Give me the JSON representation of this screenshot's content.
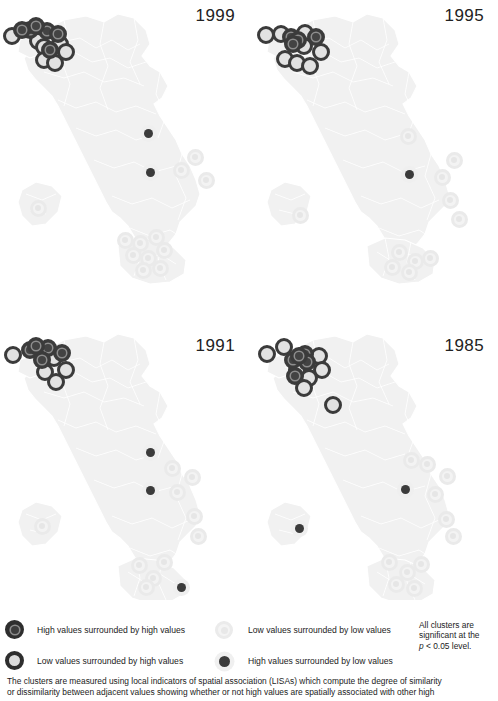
{
  "figure": {
    "caption_line1": "The clusters are measured using local indicators of spatial association (LISAs) which compute the degree of similarity",
    "caption_line2": "or dissimilarity between adjacent values showing whether or not high values are spatially associated with other high"
  },
  "legend": {
    "items": [
      {
        "key": "high-high",
        "icon": "ring-dark-core-dark-icon",
        "label": "High values surrounded by high values"
      },
      {
        "key": "low-high",
        "icon": "ring-dark-core-light-icon",
        "label": "Low values surrounded by high values"
      },
      {
        "key": "low-low",
        "icon": "ring-light-core-light-icon",
        "label": "Low values surrounded by low values"
      },
      {
        "key": "high-low",
        "icon": "dot-dark-solid-icon",
        "label": "High values surrounded by low values"
      }
    ],
    "significance_note": "All clusters are significant at the p < 0.05 level.",
    "significance_line1": "All clusters are",
    "significance_line2": "significant at the",
    "significance_line3_pre": "p",
    "significance_line3_post": " < 0.05 level."
  },
  "colors": {
    "high_high": "#3b3b3b",
    "low_high_ring": "#3b3b3b",
    "low_high_core": "#e2e2e2",
    "low_low": "#eaeaea",
    "high_low": "#3b3b3b",
    "map_fill": "#f1f1f1",
    "map_border": "#ffffff",
    "background": "#ffffff",
    "text": "#1b1b1b"
  },
  "chart_data": {
    "type": "map",
    "panel_layout": "2x2",
    "marker_categories": [
      "high-high",
      "low-high",
      "low-low",
      "high-low"
    ],
    "panels": [
      {
        "year": "1999",
        "counts": {
          "high-high": 7,
          "low-high": 7,
          "low-low": 12,
          "high-low": 2
        },
        "markers": [
          {
            "t": "lh",
            "x": 12,
            "y": 36
          },
          {
            "t": "hh",
            "x": 30,
            "y": 30
          },
          {
            "t": "lh",
            "x": 38,
            "y": 41
          },
          {
            "t": "hh",
            "x": 47,
            "y": 31
          },
          {
            "t": "hh",
            "x": 58,
            "y": 34
          },
          {
            "t": "lh",
            "x": 44,
            "y": 47
          },
          {
            "t": "hh",
            "x": 50,
            "y": 50
          },
          {
            "t": "lh",
            "x": 60,
            "y": 44
          },
          {
            "t": "lh",
            "x": 44,
            "y": 60
          },
          {
            "t": "lh",
            "x": 55,
            "y": 63
          },
          {
            "t": "lh",
            "x": 66,
            "y": 52
          },
          {
            "t": "hh",
            "x": 36,
            "y": 26
          },
          {
            "t": "hh",
            "x": 22,
            "y": 30
          },
          {
            "t": "hl",
            "x": 148,
            "y": 133
          },
          {
            "t": "hl",
            "x": 150,
            "y": 172
          },
          {
            "t": "ll",
            "x": 195,
            "y": 157
          },
          {
            "t": "ll",
            "x": 181,
            "y": 170
          },
          {
            "t": "ll",
            "x": 206,
            "y": 180
          },
          {
            "t": "ll",
            "x": 38,
            "y": 208
          },
          {
            "t": "ll",
            "x": 125,
            "y": 240
          },
          {
            "t": "ll",
            "x": 140,
            "y": 243
          },
          {
            "t": "ll",
            "x": 156,
            "y": 237
          },
          {
            "t": "ll",
            "x": 133,
            "y": 255
          },
          {
            "t": "ll",
            "x": 148,
            "y": 258
          },
          {
            "t": "ll",
            "x": 164,
            "y": 250
          },
          {
            "t": "ll",
            "x": 160,
            "y": 268
          },
          {
            "t": "ll",
            "x": 143,
            "y": 270
          }
        ]
      },
      {
        "year": "1995",
        "counts": {
          "high-high": 6,
          "low-high": 8,
          "low-low": 12,
          "high-low": 1
        },
        "markers": [
          {
            "t": "lh",
            "x": 17,
            "y": 35
          },
          {
            "t": "lh",
            "x": 32,
            "y": 34
          },
          {
            "t": "hh",
            "x": 42,
            "y": 37
          },
          {
            "t": "hh",
            "x": 49,
            "y": 40
          },
          {
            "t": "lh",
            "x": 56,
            "y": 33
          },
          {
            "t": "hh",
            "x": 67,
            "y": 37
          },
          {
            "t": "lh",
            "x": 55,
            "y": 46
          },
          {
            "t": "lh",
            "x": 72,
            "y": 52
          },
          {
            "t": "lh",
            "x": 36,
            "y": 59
          },
          {
            "t": "lh",
            "x": 48,
            "y": 63
          },
          {
            "t": "lh",
            "x": 61,
            "y": 66
          },
          {
            "t": "hh",
            "x": 44,
            "y": 44
          },
          {
            "t": "hl",
            "x": 160,
            "y": 174
          },
          {
            "t": "ll",
            "x": 159,
            "y": 136
          },
          {
            "t": "ll",
            "x": 205,
            "y": 160
          },
          {
            "t": "ll",
            "x": 193,
            "y": 177
          },
          {
            "t": "ll",
            "x": 201,
            "y": 200
          },
          {
            "t": "ll",
            "x": 210,
            "y": 219
          },
          {
            "t": "ll",
            "x": 51,
            "y": 215
          },
          {
            "t": "ll",
            "x": 150,
            "y": 252
          },
          {
            "t": "ll",
            "x": 166,
            "y": 261
          },
          {
            "t": "ll",
            "x": 181,
            "y": 258
          },
          {
            "t": "ll",
            "x": 143,
            "y": 267
          },
          {
            "t": "ll",
            "x": 160,
            "y": 272
          }
        ]
      },
      {
        "year": "1991",
        "counts": {
          "high-high": 6,
          "low-high": 6,
          "low-low": 14,
          "high-low": 3
        },
        "markers": [
          {
            "t": "lh",
            "x": 13,
            "y": 55
          },
          {
            "t": "hh",
            "x": 30,
            "y": 50
          },
          {
            "t": "hh",
            "x": 48,
            "y": 48
          },
          {
            "t": "hh",
            "x": 62,
            "y": 53
          },
          {
            "t": "hh",
            "x": 42,
            "y": 60
          },
          {
            "t": "lh",
            "x": 54,
            "y": 58
          },
          {
            "t": "lh",
            "x": 45,
            "y": 72
          },
          {
            "t": "lh",
            "x": 66,
            "y": 70
          },
          {
            "t": "lh",
            "x": 56,
            "y": 82
          },
          {
            "t": "hh",
            "x": 36,
            "y": 46
          },
          {
            "t": "hl",
            "x": 150,
            "y": 152
          },
          {
            "t": "hl",
            "x": 150,
            "y": 190
          },
          {
            "t": "hl",
            "x": 181,
            "y": 287
          },
          {
            "t": "ll",
            "x": 172,
            "y": 168
          },
          {
            "t": "ll",
            "x": 192,
            "y": 177
          },
          {
            "t": "ll",
            "x": 177,
            "y": 192
          },
          {
            "t": "ll",
            "x": 194,
            "y": 216
          },
          {
            "t": "ll",
            "x": 198,
            "y": 236
          },
          {
            "t": "ll",
            "x": 42,
            "y": 226
          },
          {
            "t": "ll",
            "x": 139,
            "y": 265
          },
          {
            "t": "ll",
            "x": 164,
            "y": 262
          },
          {
            "t": "ll",
            "x": 153,
            "y": 278
          },
          {
            "t": "ll",
            "x": 146,
            "y": 287
          }
        ]
      },
      {
        "year": "1985",
        "counts": {
          "high-high": 5,
          "low-high": 9,
          "low-low": 14,
          "high-low": 2
        },
        "markers": [
          {
            "t": "lh",
            "x": 18,
            "y": 54
          },
          {
            "t": "lh",
            "x": 35,
            "y": 47
          },
          {
            "t": "hh",
            "x": 56,
            "y": 54
          },
          {
            "t": "lh",
            "x": 70,
            "y": 56
          },
          {
            "t": "hh",
            "x": 44,
            "y": 60
          },
          {
            "t": "hh",
            "x": 58,
            "y": 62
          },
          {
            "t": "lh",
            "x": 48,
            "y": 70
          },
          {
            "t": "lh",
            "x": 73,
            "y": 70
          },
          {
            "t": "hh",
            "x": 46,
            "y": 76
          },
          {
            "t": "lh",
            "x": 60,
            "y": 78
          },
          {
            "t": "lh",
            "x": 55,
            "y": 88
          },
          {
            "t": "hh",
            "x": 50,
            "y": 56
          },
          {
            "t": "lh",
            "x": 84,
            "y": 105
          },
          {
            "t": "hl",
            "x": 156,
            "y": 189
          },
          {
            "t": "hl",
            "x": 50,
            "y": 228
          },
          {
            "t": "ll",
            "x": 162,
            "y": 160
          },
          {
            "t": "ll",
            "x": 178,
            "y": 164
          },
          {
            "t": "ll",
            "x": 198,
            "y": 176
          },
          {
            "t": "ll",
            "x": 186,
            "y": 194
          },
          {
            "t": "ll",
            "x": 197,
            "y": 219
          },
          {
            "t": "ll",
            "x": 204,
            "y": 236
          },
          {
            "t": "ll",
            "x": 140,
            "y": 262
          },
          {
            "t": "ll",
            "x": 158,
            "y": 272
          },
          {
            "t": "ll",
            "x": 172,
            "y": 264
          },
          {
            "t": "ll",
            "x": 147,
            "y": 284
          },
          {
            "t": "ll",
            "x": 165,
            "y": 288
          }
        ]
      }
    ]
  }
}
